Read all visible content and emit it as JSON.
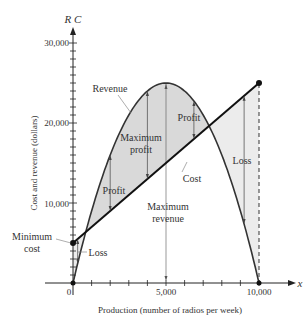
{
  "chart_data": {
    "type": "line",
    "title": "",
    "xlabel": "Production (number of radios per week)",
    "ylabel": "Cost and revenue (dollars)",
    "x_axis_var": "x",
    "y_axis_var": "R C",
    "xlim": [
      0,
      10000
    ],
    "ylim": [
      0,
      30000
    ],
    "x_ticks": [
      0,
      5000,
      10000
    ],
    "x_tick_labels": [
      "0",
      "5,000",
      "10,000"
    ],
    "x_minor_step": 1000,
    "y_ticks": [
      10000,
      20000,
      30000
    ],
    "y_tick_labels": [
      "10,000",
      "20,000",
      "30,000"
    ],
    "y_minor_step": 1000,
    "grid": false,
    "series": [
      {
        "name": "Revenue",
        "formula": "R(x) = 10x - 0.001x^2",
        "x": [
          0,
          1000,
          2000,
          3000,
          4000,
          5000,
          6000,
          7000,
          8000,
          9000,
          10000
        ],
        "values": [
          0,
          9000,
          16000,
          21000,
          24000,
          25000,
          24000,
          21000,
          16000,
          9000,
          0
        ],
        "color": "#333333"
      },
      {
        "name": "Cost",
        "formula": "C(x) = 5000 + 2x",
        "x": [
          0,
          10000
        ],
        "values": [
          5000,
          25000
        ],
        "color": "#111111"
      }
    ],
    "key_points": [
      {
        "label": "Minimum cost",
        "x": 0,
        "y": 5000
      },
      {
        "label": "Maximum revenue",
        "x": 5000,
        "y": 25000
      },
      {
        "label": "Break-even (left)",
        "x": 684,
        "y": 6368
      },
      {
        "label": "Break-even (right)",
        "x": 7316,
        "y": 19632
      },
      {
        "label": "Cost at 10,000",
        "x": 10000,
        "y": 25000
      }
    ],
    "regions": [
      {
        "label": "Loss",
        "x_range": [
          0,
          684
        ]
      },
      {
        "label": "Profit",
        "x_range": [
          684,
          7316
        ]
      },
      {
        "label": "Loss",
        "x_range": [
          7316,
          10000
        ]
      }
    ],
    "annotations": [
      "Revenue",
      "Maximum profit",
      "Profit",
      "Profit",
      "Cost",
      "Maximum revenue",
      "Minimum cost",
      "Loss",
      "Loss"
    ]
  },
  "labels": {
    "y_var": "R C",
    "x_var": "x",
    "xlabel": "Production (number of radios per week)",
    "ylabel": "Cost and revenue (dollars)",
    "revenue": "Revenue",
    "cost": "Cost",
    "max_profit_1": "Maximum",
    "max_profit_2": "profit",
    "profit_left": "Profit",
    "profit_right": "Profit",
    "max_revenue_1": "Maximum",
    "max_revenue_2": "revenue",
    "min_cost_1": "Minimum",
    "min_cost_2": "cost",
    "loss_left": "Loss",
    "loss_right": "Loss",
    "origin": "0",
    "x_5000": "5,000",
    "x_10000": "10,000",
    "y_10000": "10,000",
    "y_20000": "20,000",
    "y_30000": "30,000"
  },
  "colors": {
    "profit_fill": "#d9d9d9",
    "loss_fill": "#ececec",
    "axis": "#222222",
    "text": "#333333"
  }
}
